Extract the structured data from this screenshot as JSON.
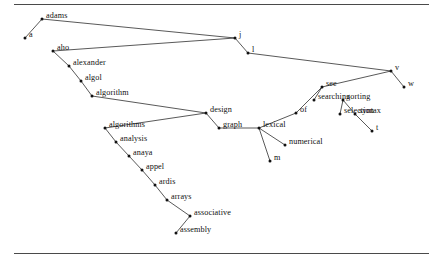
{
  "figure": {
    "kind": "node-link-tree-diagram",
    "width": 443,
    "height": 267,
    "background_color": "#ffffff",
    "ink_color": "#111111",
    "rule_color": "#4a4a4a",
    "rules": [
      {
        "name": "rule-top",
        "y": 4
      },
      {
        "name": "rule-bottom",
        "y": 253
      }
    ]
  },
  "chart_data": {
    "type": "scatter",
    "title": "",
    "xlabel": "",
    "ylabel": "",
    "grid": false,
    "legend": "none",
    "xlim": [
      0,
      443
    ],
    "ylim": [
      0,
      267
    ],
    "nodes": [
      {
        "id": "adams",
        "label": "adams",
        "x": 42,
        "y": 19,
        "label_dx": 4,
        "label_dy": 3
      },
      {
        "id": "a",
        "label": "a",
        "x": 25,
        "y": 38,
        "label_dx": 4,
        "label_dy": 3
      },
      {
        "id": "aho",
        "label": "aho",
        "x": 53,
        "y": 51,
        "label_dx": 4,
        "label_dy": 3
      },
      {
        "id": "alexander",
        "label": "alexander",
        "x": 69,
        "y": 66,
        "label_dx": 4,
        "label_dy": 3
      },
      {
        "id": "algol",
        "label": "algol",
        "x": 81,
        "y": 81,
        "label_dx": 4,
        "label_dy": 3
      },
      {
        "id": "algorithm",
        "label": "algorithm",
        "x": 92,
        "y": 96,
        "label_dx": 4,
        "label_dy": 3
      },
      {
        "id": "algorithms",
        "label": "algorithms",
        "x": 105,
        "y": 128,
        "label_dx": 4,
        "label_dy": 3
      },
      {
        "id": "analysis",
        "label": "analysis",
        "x": 116,
        "y": 142,
        "label_dx": 4,
        "label_dy": 3
      },
      {
        "id": "anaya",
        "label": "anaya",
        "x": 129,
        "y": 156,
        "label_dx": 4,
        "label_dy": 3
      },
      {
        "id": "appel",
        "label": "appel",
        "x": 142,
        "y": 170,
        "label_dx": 4,
        "label_dy": 3
      },
      {
        "id": "ardis",
        "label": "ardis",
        "x": 155,
        "y": 185,
        "label_dx": 4,
        "label_dy": 3
      },
      {
        "id": "arrays",
        "label": "arrays",
        "x": 167,
        "y": 200,
        "label_dx": 4,
        "label_dy": 3
      },
      {
        "id": "associative",
        "label": "associative",
        "x": 190,
        "y": 216,
        "label_dx": 4,
        "label_dy": 3
      },
      {
        "id": "assembly",
        "label": "assembly",
        "x": 176,
        "y": 233,
        "label_dx": 4,
        "label_dy": 3
      },
      {
        "id": "design",
        "label": "design",
        "x": 206,
        "y": 113,
        "label_dx": 4,
        "label_dy": 3
      },
      {
        "id": "graph",
        "label": "graph",
        "x": 219,
        "y": 128,
        "label_dx": 4,
        "label_dy": 3
      },
      {
        "id": "j",
        "label": "j",
        "x": 235,
        "y": 38,
        "label_dx": 4,
        "label_dy": 3
      },
      {
        "id": "l",
        "label": "l",
        "x": 248,
        "y": 53,
        "label_dx": 4,
        "label_dy": 3
      },
      {
        "id": "lexical",
        "label": "lexical",
        "x": 259,
        "y": 128,
        "label_dx": 4,
        "label_dy": 3
      },
      {
        "id": "numerical",
        "label": "numerical",
        "x": 285,
        "y": 145,
        "label_dx": 4,
        "label_dy": 3
      },
      {
        "id": "m",
        "label": "m",
        "x": 270,
        "y": 161,
        "label_dx": 4,
        "label_dy": 3
      },
      {
        "id": "of",
        "label": "of",
        "x": 296,
        "y": 113,
        "label_dx": 4,
        "label_dy": 3
      },
      {
        "id": "see",
        "label": "see",
        "x": 322,
        "y": 87,
        "label_dx": 4,
        "label_dy": 3
      },
      {
        "id": "searching",
        "label": "searching",
        "x": 314,
        "y": 100,
        "label_dx": 4,
        "label_dy": 3
      },
      {
        "id": "sorting",
        "label": "sorting",
        "x": 343,
        "y": 100,
        "label_dx": 4,
        "label_dy": 3
      },
      {
        "id": "selection",
        "label": "selection",
        "x": 340,
        "y": 114,
        "label_dx": 4,
        "label_dy": 3
      },
      {
        "id": "syntax",
        "label": "syntax",
        "x": 355,
        "y": 114,
        "label_dx": 4,
        "label_dy": 3
      },
      {
        "id": "t",
        "label": "t",
        "x": 372,
        "y": 131,
        "label_dx": 4,
        "label_dy": 3
      },
      {
        "id": "v",
        "label": "v",
        "x": 391,
        "y": 71,
        "label_dx": 4,
        "label_dy": 3
      },
      {
        "id": "w",
        "label": "w",
        "x": 404,
        "y": 87,
        "label_dx": 4,
        "label_dy": 3
      }
    ],
    "edges": [
      {
        "from": "a",
        "to": "adams"
      },
      {
        "from": "adams",
        "to": "j"
      },
      {
        "from": "aho",
        "to": "j"
      },
      {
        "from": "aho",
        "to": "alexander"
      },
      {
        "from": "alexander",
        "to": "algol"
      },
      {
        "from": "algol",
        "to": "algorithm"
      },
      {
        "from": "algorithm",
        "to": "design"
      },
      {
        "from": "algorithms",
        "to": "design"
      },
      {
        "from": "algorithms",
        "to": "analysis"
      },
      {
        "from": "analysis",
        "to": "anaya"
      },
      {
        "from": "anaya",
        "to": "appel"
      },
      {
        "from": "appel",
        "to": "ardis"
      },
      {
        "from": "ardis",
        "to": "arrays"
      },
      {
        "from": "arrays",
        "to": "associative"
      },
      {
        "from": "associative",
        "to": "assembly"
      },
      {
        "from": "design",
        "to": "graph"
      },
      {
        "from": "graph",
        "to": "lexical"
      },
      {
        "from": "j",
        "to": "l"
      },
      {
        "from": "l",
        "to": "v"
      },
      {
        "from": "lexical",
        "to": "numerical"
      },
      {
        "from": "lexical",
        "to": "m"
      },
      {
        "from": "of",
        "to": "lexical"
      },
      {
        "from": "of",
        "to": "see"
      },
      {
        "from": "see",
        "to": "searching"
      },
      {
        "from": "see",
        "to": "v"
      },
      {
        "from": "sorting",
        "to": "selection"
      },
      {
        "from": "sorting",
        "to": "syntax"
      },
      {
        "from": "syntax",
        "to": "t"
      },
      {
        "from": "v",
        "to": "w"
      }
    ]
  }
}
